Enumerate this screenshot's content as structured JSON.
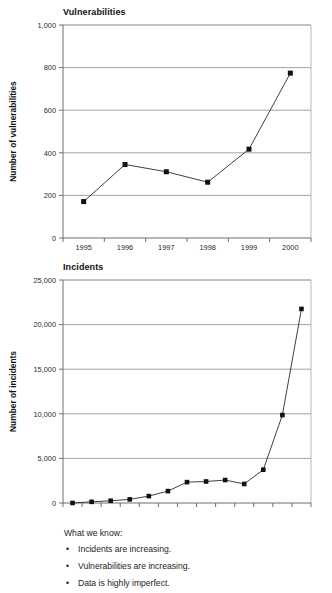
{
  "charts": [
    {
      "id": "vulnerabilities",
      "title": "Vulnerabilities",
      "ylabel": "Number of vulnerabilities",
      "ytick_labels": [
        "1,000",
        "800",
        "600",
        "400",
        "200",
        "0"
      ],
      "xtick_labels": [
        "1995",
        "1996",
        "1997",
        "1998",
        "1999",
        "2000"
      ]
    },
    {
      "id": "incidents",
      "title": "Incidents",
      "ylabel": "Number of incidents",
      "ytick_labels": [
        "25,000",
        "20,000",
        "15,000",
        "10,000",
        "5,000",
        "0"
      ],
      "xtick_labels": [
        "1988",
        "1989",
        "1990",
        "1991",
        "1992",
        "1993",
        "1994",
        "1995",
        "1996",
        "1997",
        "1998",
        "1999",
        "2000"
      ]
    }
  ],
  "notes": {
    "heading": "What we know:",
    "bullet_glyph": "•",
    "items": [
      "Incidents are increasing.",
      "Vulnerabilities are increasing.",
      "Data is highly imperfect."
    ]
  },
  "colors": {
    "line": "#2a2a2a",
    "marker": "#111111",
    "grid": "#8c8c8c",
    "axis": "#6e6e6e",
    "text": "#1d1d1d",
    "background": "#ffffff"
  },
  "chart_data": [
    {
      "type": "line",
      "title": "Vulnerabilities",
      "xlabel": "",
      "ylabel": "Number of vulnerabilities",
      "categories": [
        "1995",
        "1996",
        "1997",
        "1998",
        "1999",
        "2000"
      ],
      "values": [
        171,
        345,
        311,
        262,
        417,
        774
      ],
      "ylim": [
        0,
        1000
      ],
      "yticks": [
        0,
        200,
        400,
        600,
        800,
        1000
      ],
      "grid": true,
      "legend": "none",
      "marker": "square"
    },
    {
      "type": "line",
      "title": "Incidents",
      "xlabel": "",
      "ylabel": "Number of incidents",
      "categories": [
        "1988",
        "1989",
        "1990",
        "1991",
        "1992",
        "1993",
        "1994",
        "1995",
        "1996",
        "1997",
        "1998",
        "1999",
        "2000"
      ],
      "values": [
        6,
        132,
        252,
        406,
        773,
        1334,
        2340,
        2412,
        2573,
        2134,
        3734,
        9859,
        21756
      ],
      "ylim": [
        0,
        25000
      ],
      "yticks": [
        0,
        5000,
        10000,
        15000,
        20000,
        25000
      ],
      "grid": true,
      "legend": "none",
      "marker": "square"
    }
  ]
}
